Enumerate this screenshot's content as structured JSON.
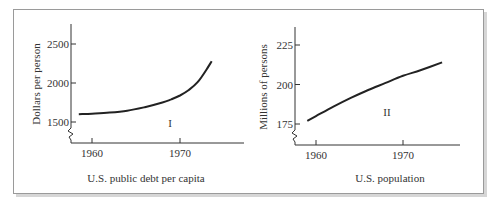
{
  "chart_data": [
    {
      "type": "line",
      "panel_label": "I",
      "title": "U.S. public debt per capita",
      "xlabel": "",
      "ylabel": "Dollars per person",
      "x_ticks": [
        "1960",
        "1970"
      ],
      "y_ticks": [
        "1500",
        "2000",
        "2500"
      ],
      "ylim": [
        1250,
        2750
      ],
      "xlim": [
        1957,
        1976
      ],
      "axis_break": true,
      "grid": false,
      "series": [
        {
          "name": "Debt per capita",
          "x": [
            1958.5,
            1960,
            1962,
            1964,
            1966,
            1968,
            1969,
            1970,
            1971,
            1972,
            1973,
            1973.6
          ],
          "values": [
            1600,
            1605,
            1620,
            1645,
            1690,
            1750,
            1790,
            1840,
            1910,
            2010,
            2170,
            2280
          ]
        }
      ]
    },
    {
      "type": "line",
      "panel_label": "II",
      "title": "U.S. population",
      "xlabel": "",
      "ylabel": "Millions of persons",
      "x_ticks": [
        "1960",
        "1970"
      ],
      "y_ticks": [
        "175",
        "200",
        "225"
      ],
      "ylim": [
        162,
        238
      ],
      "xlim": [
        1957,
        1977
      ],
      "axis_break": true,
      "grid": false,
      "series": [
        {
          "name": "Population",
          "x": [
            1959,
            1960,
            1962,
            1964,
            1966,
            1968,
            1970,
            1972,
            1974.5
          ],
          "values": [
            177,
            180,
            186,
            191.5,
            196.5,
            201,
            205.5,
            209,
            214
          ]
        }
      ]
    }
  ]
}
